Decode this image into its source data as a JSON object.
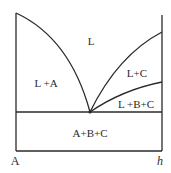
{
  "diagram": {
    "type": "ternary-eutectic phase diagram (isopleth section)",
    "axis_labels": {
      "left": "A",
      "right": "h"
    },
    "regions": {
      "liquid": "L",
      "liquid_a": "L +A",
      "liquid_c": "L+C",
      "liquid_bc": "L +B+C",
      "solid_abc": "A+B+C"
    },
    "colors": {
      "line": "#2a2a2a",
      "background": "#ffffff"
    }
  }
}
